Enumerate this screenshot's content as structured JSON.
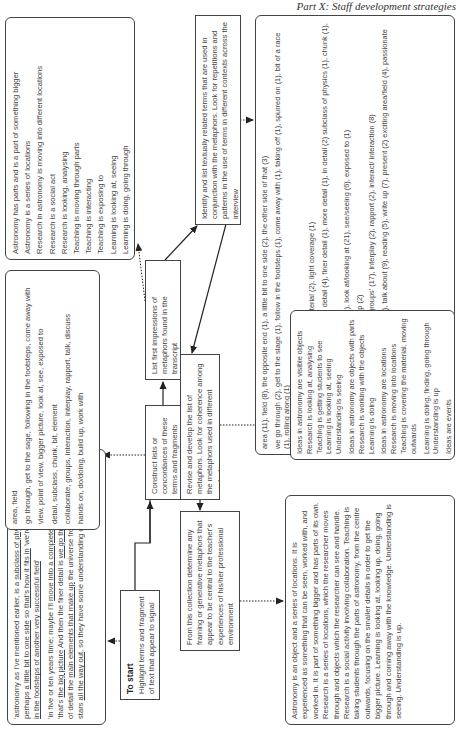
{
  "header": {
    "title": "Part X: Staff development strategies"
  },
  "steps": {
    "start": {
      "title": "To start",
      "text": "Highlight terms and fragment of text that appear to signal metaphors"
    },
    "construct": {
      "text": "Construct lists or concordances of these terms and fragments"
    },
    "list_first": {
      "line1": "List first impressions of metaphors found in the transcript",
      "line2": "Focus on the contexts"
    },
    "identify": {
      "text": "Identify and list textually related terms that are used in conjunction with the metaphors. Look for repetitions and patterns in the use of terms in different contexts across the interview"
    },
    "revise": {
      "text": "Revise and develop the list of metaphors. Look for coherence among the metaphors used in different contexts."
    },
    "determine": {
      "text": "From this collection determine any framing or generative metaphors that appear to be central to the teacher's experiences of his/her professional environment"
    }
  },
  "quote_box": {
    "para1": [
      {
        "t": "'astronomy as I've mentioned earlier, is a ",
        "u": false
      },
      {
        "t": "subclass of physics",
        "u": true
      },
      {
        "t": " although perhaps ",
        "u": false
      },
      {
        "t": "a little bit to one side",
        "u": true
      },
      {
        "t": " so ",
        "u": false
      },
      {
        "t": "that's how it fits in",
        "u": true
      },
      {
        "t": " 'we're ",
        "u": false
      },
      {
        "t": "following very much in the footsteps of another very successful field",
        "u": true
      },
      {
        "t": "'",
        "u": false
      }
    ],
    "para2": [
      {
        "t": "'in five or ten years time; maybe I'll ",
        "u": false
      },
      {
        "t": "move into a completely different field",
        "u": true
      },
      {
        "t": "' 'that's ",
        "u": false
      },
      {
        "t": "the big picture",
        "u": true
      },
      {
        "t": " And then the finer detail is ",
        "u": false
      },
      {
        "t": "we go through",
        "u": true
      },
      {
        "t": " in a fair amount of detail the ",
        "u": false
      },
      {
        "t": "main elements that make up",
        "u": true
      },
      {
        "t": " the universe from planets through stars ",
        "u": false
      },
      {
        "t": "all the way out",
        "u": true
      },
      {
        "t": ", so they have some understanding of them'",
        "u": false
      }
    ]
  },
  "terms_box": {
    "lines": [
      "area, field",
      "go through, get to the sage, following in the footsteps, come away with",
      "view, point of view, bigger picture, look at, see, exposed to",
      "detail, subclass, chunk, bit, element",
      "collaborate, groups, interaction, interplay, rapport, talk, discuss",
      "hands on, do/doing, build up, work with"
    ]
  },
  "metaphor_list": {
    "items": [
      "Astronomy has parts and is a part of something bigger",
      "Astronomy is a series of locations",
      "Research in astronomy is moving into different locations",
      "Research is a social act",
      "Research is looking, analysing",
      "Teaching is moving through parts",
      "Teaching is interacting",
      "Teaching is exposing to",
      "Learning is looking at, seeing",
      "Learning is doing, going through"
    ]
  },
  "counts_box": {
    "lines": [
      "area (11), field (8), the opposite end (1), a little bit to one side (2), the other side of that (3)",
      "we go through (2), get to the stage (1), follow in the footsteps (1), come away with (1), taking off (1), spurred on (1), bit of a race (1), rolling along (1)",
      "holy grail (1), surprises (3), find (3),",
      "overall (1), underlying (3), covering the material (2), light coverage (1)",
      "tiny fraction (1), has 'bits' (1), elements (1), detail (4), finer detail (1), more detail (1), in detail (2) subclass of physics (1), chunk (1), remove content (1)",
      "bigger picture (2), view (4), point of view (2), look at/looking at (21), see/seeing (6), exposed to (1)",
      "get my hands on (1), do/doing (15), build up (2)",
      "collaborate/collaboration (16), working in 'groups' (17), interplay (2), rapport (2), interact/ interaction (8)",
      "discuss (2), talk (17) talk with (1), talk to (1), talk about (9), reading (5), write up (7), present (2) exciting area/field (4), passionate (4), interest (3), inspire (1)"
    ]
  },
  "ideas_box": {
    "lines": [
      "Ideas in astronomy are visible objects Research is looking at, analysing Teaching is getting students to see Learning is looking at, seeing Understanding is seeing",
      "Ideas in astronomy are objects with parts Research is working with the objects Learning is doing",
      "Ideas in astronomy are locations Research is moving into locations Teaching is covering the material, moving outwards",
      "Learning is doing, finding, going through Understanding is up",
      "Ideas are events",
      "Research is collaboration, excitement, passion",
      "Teaching is establishing interaction, inspiring",
      "Learning is interaction, interplay, discussing"
    ]
  },
  "summary_box": {
    "text": "Astronomy is an object and a series of locations. It is experienced as something that can be seen, worked with, and worked in. It is part of something bigger and has parts of its own. Research is a series of locations, which the researcher moves through and objects which the researcher can see and handle. Research is a social activity involving collaboration. Teaching is taking students through the parts of astronomy, from the centre outwards, focusing on the smaller details in order to get the bigger picture. Learning is looking at, looking up, doing, going through and coming away with the knowledge. Understanding is seeing. Understanding is up."
  },
  "colors": {
    "border": "#444444",
    "text": "#444444",
    "arrow": "#222222"
  }
}
